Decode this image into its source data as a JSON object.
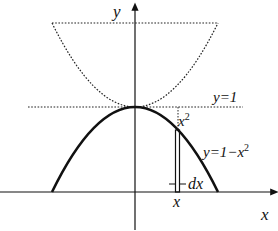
{
  "diagram": {
    "axes": {
      "x_label": "x",
      "y_label": "y"
    },
    "curves": {
      "main_parabola": {
        "equation": "y=1−x²",
        "label_prefix": "y=1−x",
        "label_exp": "2",
        "style": "solid-bold"
      },
      "reflected_parabola": {
        "equation": "y=1+x²",
        "style": "dotted"
      },
      "horizontal_line": {
        "label": "y=1",
        "style": "dotted"
      }
    },
    "annotations": {
      "gap_label_base": "x",
      "gap_label_exp": "2",
      "strip_width_label": "dx",
      "strip_position_label": "x"
    },
    "colors": {
      "ink": "#111111",
      "background": "#ffffff"
    }
  }
}
